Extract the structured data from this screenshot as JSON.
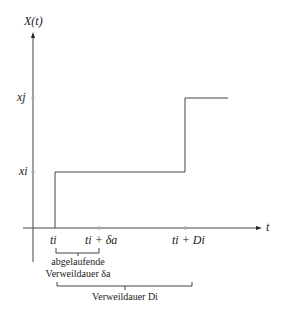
{
  "diagram": {
    "y_axis_label": "X(t)",
    "x_axis_label": "t",
    "y_levels": [
      {
        "label": "x_j",
        "text": "xj"
      },
      {
        "label": "x_i",
        "text": "xi"
      }
    ],
    "x_ticks": [
      {
        "text": "ti"
      },
      {
        "text": "ti + δa"
      },
      {
        "text": "ti + Di"
      }
    ],
    "braces": [
      {
        "line1": "abgelaufende",
        "line2": "Verweildauer δa"
      },
      {
        "line1": "Verweildauer Di"
      }
    ],
    "colors": {
      "line": "#444444",
      "text": "#222222",
      "background": "#ffffff"
    }
  }
}
